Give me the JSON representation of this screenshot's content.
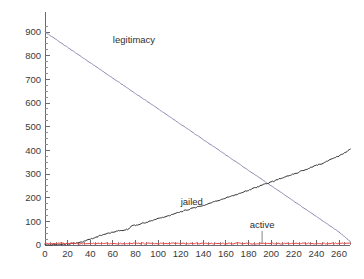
{
  "chart_data": {
    "type": "line",
    "title": "",
    "subtitle": "",
    "xlabel": "",
    "ylabel": "",
    "xlim": [
      0,
      272
    ],
    "ylim": [
      0,
      930
    ],
    "grid": false,
    "legend_position": "inline-annotations",
    "x_ticks": [
      0,
      20,
      40,
      60,
      80,
      100,
      120,
      140,
      160,
      180,
      200,
      220,
      240,
      260
    ],
    "x_tick_labels": [
      "0",
      "20",
      "40",
      "60",
      "80",
      "100",
      "120",
      "140",
      "160",
      "180",
      "200",
      "220",
      "240",
      "260"
    ],
    "x_minor_tick_step": 5,
    "y_ticks": [
      0,
      100,
      200,
      300,
      400,
      500,
      600,
      700,
      800,
      900
    ],
    "y_tick_labels": [
      "0",
      "100",
      "200",
      "300",
      "400",
      "500",
      "600",
      "700",
      "800",
      "900"
    ],
    "y_minor_tick_step": 25,
    "series": [
      {
        "name": "legitimacy",
        "color": "#8a8ab4",
        "label": "legitimacy",
        "label_x": 60,
        "label_y": 855,
        "x": [
          0,
          10,
          20,
          30,
          40,
          50,
          60,
          70,
          80,
          90,
          100,
          110,
          120,
          130,
          140,
          150,
          160,
          170,
          180,
          190,
          200,
          210,
          220,
          230,
          240,
          250,
          260,
          270
        ],
        "values": [
          900,
          868,
          835,
          803,
          770,
          738,
          705,
          673,
          640,
          608,
          575,
          543,
          510,
          478,
          445,
          413,
          380,
          348,
          315,
          283,
          250,
          218,
          185,
          153,
          120,
          88,
          55,
          15
        ]
      },
      {
        "name": "jailed",
        "color": "#303030",
        "label": "jailed",
        "label_x": 120,
        "label_y": 168,
        "x": [
          0,
          5,
          10,
          15,
          20,
          25,
          30,
          35,
          40,
          45,
          50,
          55,
          60,
          65,
          70,
          73,
          76,
          80,
          85,
          90,
          95,
          100,
          105,
          110,
          115,
          120,
          125,
          130,
          135,
          140,
          145,
          150,
          155,
          160,
          165,
          170,
          175,
          180,
          185,
          190,
          195,
          200,
          205,
          210,
          215,
          220,
          225,
          230,
          235,
          240,
          245,
          250,
          255,
          260,
          265,
          270
        ],
        "values": [
          0,
          1,
          2,
          3,
          4,
          6,
          9,
          16,
          25,
          33,
          42,
          49,
          55,
          60,
          64,
          66,
          78,
          84,
          90,
          97,
          104,
          111,
          118,
          125,
          132,
          140,
          147,
          155,
          162,
          168,
          176,
          184,
          191,
          199,
          207,
          215,
          223,
          232,
          240,
          249,
          258,
          266,
          275,
          284,
          292,
          300,
          309,
          318,
          327,
          336,
          345,
          355,
          365,
          377,
          390,
          404
        ]
      },
      {
        "name": "active",
        "color": "#ee3b3b",
        "label": "active",
        "label_x": 192,
        "label_y": 72,
        "leader_to_x": 192,
        "leader_to_y": 8,
        "x": [
          0,
          10,
          20,
          30,
          40,
          50,
          60,
          70,
          80,
          90,
          100,
          110,
          120,
          130,
          140,
          150,
          160,
          170,
          180,
          190,
          200,
          210,
          220,
          230,
          240,
          250,
          260,
          270
        ],
        "values": [
          6,
          6,
          7,
          6,
          6,
          7,
          6,
          6,
          7,
          6,
          6,
          7,
          6,
          6,
          7,
          6,
          6,
          7,
          6,
          6,
          7,
          6,
          6,
          7,
          6,
          6,
          7,
          6
        ]
      }
    ]
  },
  "annotations": {
    "legitimacy_label": "legitimacy",
    "jailed_label": "jailed",
    "active_label": "active"
  }
}
